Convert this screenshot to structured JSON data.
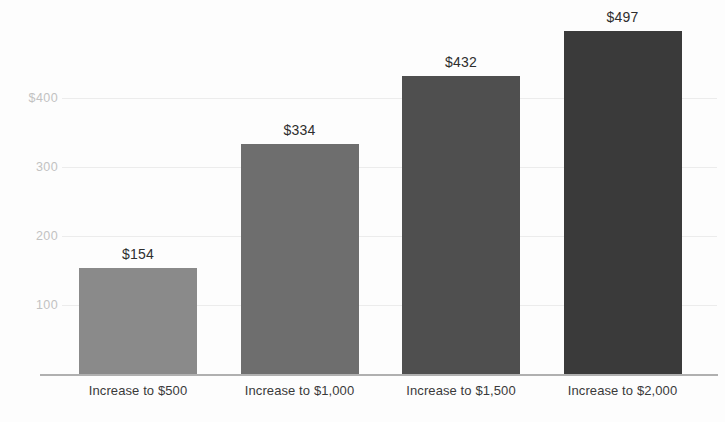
{
  "chart_data": {
    "type": "bar",
    "title": "",
    "subtitle": "",
    "xlabel": "",
    "ylabel": "",
    "categories": [
      "Increase to $500",
      "Increase to $1,000",
      "Increase to $1,500",
      "Increase to $2,000"
    ],
    "values": [
      154,
      334,
      432,
      497
    ],
    "value_labels": [
      "$154",
      "$334",
      "$432",
      "$497"
    ],
    "bar_colors": [
      "#8a8a8a",
      "#6e6e6e",
      "#4f4f4f",
      "#3a3a3a"
    ],
    "ylim": [
      0,
      497
    ],
    "yticks": [
      100,
      200,
      300,
      400
    ],
    "ytick_labels": [
      "100",
      "200",
      "300",
      "$400"
    ],
    "grid": true,
    "legend": "none",
    "axis_color": "#b0b0b0",
    "gridline_color": "#ececec",
    "tick_label_color": "#c2c2c2",
    "category_label_color": "#3a3a3a",
    "value_label_color": "#2e2e2e",
    "background_color": "#fdfdfd"
  }
}
